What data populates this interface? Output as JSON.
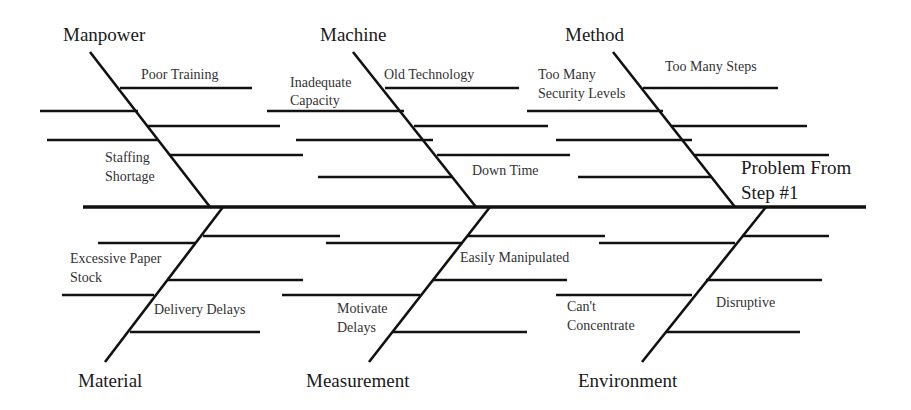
{
  "diagram": {
    "type": "fishbone",
    "problem": {
      "line1": "Problem From",
      "line2": "Step #1"
    },
    "categories": [
      {
        "name": "Manpower",
        "position": "top",
        "causes": [
          {
            "line1": "Poor Training"
          },
          {
            "line1": "Staffing",
            "line2": "Shortage"
          }
        ]
      },
      {
        "name": "Machine",
        "position": "top",
        "causes": [
          {
            "line1": "Inadequate",
            "line2": "Capacity"
          },
          {
            "line1": "Old Technology"
          },
          {
            "line1": "Down Time"
          }
        ]
      },
      {
        "name": "Method",
        "position": "top",
        "causes": [
          {
            "line1": "Too Many",
            "line2": "Security Levels"
          },
          {
            "line1": "Too Many Steps"
          }
        ]
      },
      {
        "name": "Material",
        "position": "bottom",
        "causes": [
          {
            "line1": "Excessive Paper",
            "line2": "Stock"
          },
          {
            "line1": "Delivery Delays"
          }
        ]
      },
      {
        "name": "Measurement",
        "position": "bottom",
        "causes": [
          {
            "line1": "Easily Manipulated"
          },
          {
            "line1": "Motivate",
            "line2": "Delays"
          }
        ]
      },
      {
        "name": "Environment",
        "position": "bottom",
        "causes": [
          {
            "line1": "Can't",
            "line2": "Concentrate"
          },
          {
            "line1": "Disruptive"
          }
        ]
      }
    ],
    "colors": {
      "line": "#111111",
      "text": "#333333",
      "background": "#ffffff"
    }
  }
}
